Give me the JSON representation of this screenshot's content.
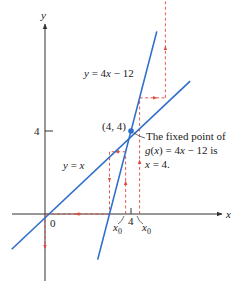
{
  "figure": {
    "axes": {
      "x_label": "x",
      "y_label": "y",
      "origin_label": "0",
      "x_tick_label": "4",
      "y_tick_label": "4"
    },
    "lines": [
      {
        "name": "identity",
        "label": "y = x",
        "slope": 1,
        "intercept": 0,
        "color": "#2f6fc9"
      },
      {
        "name": "g",
        "label": "y = 4x − 12",
        "slope": 4,
        "intercept": -12,
        "color": "#2f6fc9"
      }
    ],
    "fixed_point": {
      "x": 4,
      "y": 4,
      "label": "(4, 4)",
      "color": "#2f6fc9"
    },
    "annotation": {
      "lines": [
        "The fixed point of",
        "g(x) = 4x − 12 is",
        "x = 4."
      ]
    },
    "cobwebs": [
      {
        "name": "right",
        "x0_label": "x",
        "x0_sub": "0",
        "x0": 4.4,
        "color": "#e0493f"
      },
      {
        "name": "left",
        "x0_label": "x",
        "x0_sub": "0",
        "x0": 3.75,
        "color": "#e0493f"
      }
    ]
  }
}
